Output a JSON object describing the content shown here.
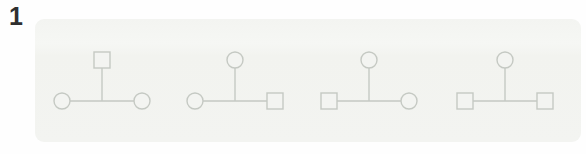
{
  "question": {
    "number": "1"
  },
  "palette": {
    "card_bg": "#f3f4f1",
    "shape_stroke": "#c5c9c3",
    "number_color": "#2f2f2f",
    "page_bg": "#fefefe"
  },
  "diagrams": [
    {
      "name": "pedigree-option-1",
      "top": "square",
      "bottom_left": "circle",
      "bottom_right": "circle"
    },
    {
      "name": "pedigree-option-2",
      "top": "circle",
      "bottom_left": "circle",
      "bottom_right": "square"
    },
    {
      "name": "pedigree-option-3",
      "top": "circle",
      "bottom_left": "square",
      "bottom_right": "circle"
    },
    {
      "name": "pedigree-option-4",
      "top": "circle",
      "bottom_left": "square",
      "bottom_right": "square"
    }
  ]
}
